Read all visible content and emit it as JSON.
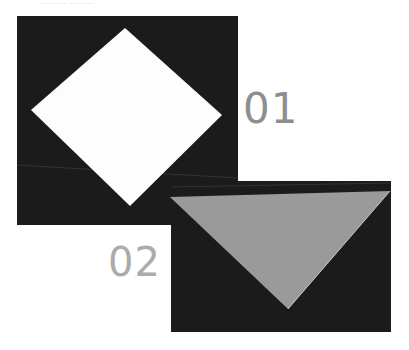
{
  "caption": "......... ........",
  "steps": [
    {
      "label": "01",
      "color": "#8e8e8e",
      "shape": "diamond",
      "shape_color": "#ffffff"
    },
    {
      "label": "02",
      "color": "#ababab",
      "shape": "triangle",
      "shape_color": "#9a9a9a"
    }
  ],
  "colors": {
    "panel_bg": "#1b1b1b",
    "page_bg": "#ffffff"
  }
}
